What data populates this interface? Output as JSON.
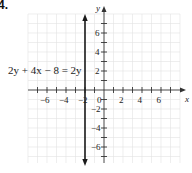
{
  "problem": {
    "number": "4."
  },
  "equation": {
    "text": "2y + 4x − 8 = 2y"
  },
  "axes": {
    "x_label": "x",
    "y_label": "y",
    "x_tick_labels": [
      "−6",
      "−4",
      "−2",
      "2",
      "4",
      "6"
    ],
    "y_tick_labels": [
      "6",
      "4",
      "2",
      "−2",
      "−4",
      "−6"
    ],
    "origin_label": "0"
  },
  "graph": {
    "x_range": [
      -8,
      8
    ],
    "y_range": [
      -8,
      8
    ],
    "grid_color": "#e2e2e2",
    "axis_color": "#333333",
    "line_color": "#1a1a1a",
    "plotted_line": {
      "type": "vertical",
      "x": -2
    }
  }
}
